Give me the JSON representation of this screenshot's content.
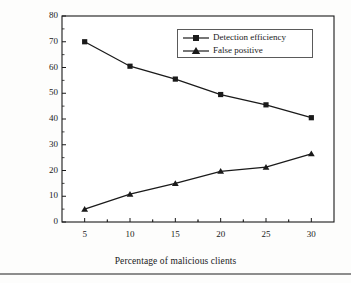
{
  "chart_data": {
    "type": "line",
    "title": "",
    "xlabel": "Percentage of malicious clients",
    "ylabel": "Detection efficiency and false positive (%)",
    "x": [
      5,
      10,
      15,
      20,
      25,
      30
    ],
    "xticklabels": [
      "5",
      "10",
      "15",
      "20",
      "25",
      "30"
    ],
    "yticklabels": [
      "0",
      "10",
      "20",
      "30",
      "40",
      "50",
      "60",
      "70",
      "80"
    ],
    "yticks": [
      0,
      10,
      20,
      30,
      40,
      50,
      60,
      70,
      80
    ],
    "xlim": [
      2.5,
      32.5
    ],
    "ylim": [
      0,
      80
    ],
    "grid": false,
    "legend_position": "upper right",
    "series": [
      {
        "name": "Detection efficiency",
        "marker": "square",
        "color": "#1a1a1a",
        "values": [
          70,
          60.5,
          55.5,
          49.5,
          45.5,
          40.5
        ]
      },
      {
        "name": "False positive",
        "marker": "triangle",
        "color": "#1a1a1a",
        "values": [
          5,
          10.8,
          15,
          19.7,
          21.3,
          26.5
        ]
      }
    ]
  },
  "colors": {
    "axis": "#1a1a1a",
    "plot_background": "#ffffff",
    "figure_background": "#fdfdfc",
    "rule": "#8d8d8d"
  }
}
